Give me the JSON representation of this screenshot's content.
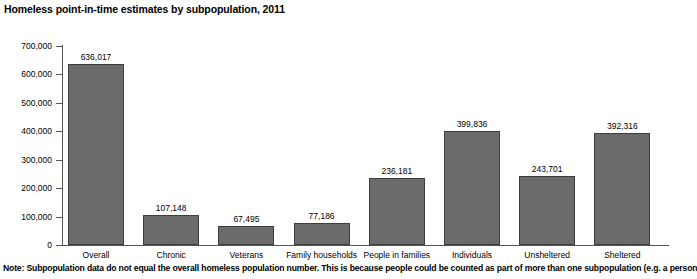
{
  "chart_data": {
    "type": "bar",
    "title": "Homeless point-in-time estimates by subpopulation, 2011",
    "xlabel": "",
    "ylabel": "",
    "ylim": [
      0,
      700000
    ],
    "yticks": [
      0,
      100000,
      200000,
      300000,
      400000,
      500000,
      600000,
      700000
    ],
    "ytick_labels": [
      "0",
      "100,000",
      "200,000",
      "300,000",
      "400,000",
      "500,000",
      "600,000",
      "700,000"
    ],
    "grid": false,
    "legend": false,
    "categories": [
      "Overall",
      "Chronic",
      "Veterans",
      "Family households",
      "People in families",
      "Individuals",
      "Unsheltered",
      "Sheltered"
    ],
    "values": [
      636017,
      107148,
      67495,
      77186,
      236181,
      399836,
      243701,
      392316
    ],
    "value_labels": [
      "636,017",
      "107,148",
      "67,495",
      "77,186",
      "236,181",
      "399,836",
      "243,701",
      "392,316"
    ],
    "bar_color": "#6b6b6b",
    "bar_edge_color": "#3d3d3d",
    "axis_color": "#555555",
    "background_color": "#ffffff"
  },
  "note": "Note: Subpopulation data do not equal the overall homeless population number. This is because people could be counted as part of more than one subpopulation (e.g. a person"
}
